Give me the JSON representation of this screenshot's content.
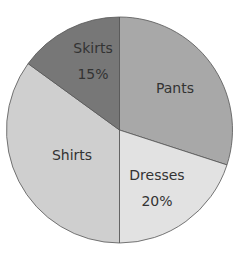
{
  "chart_data": {
    "type": "pie",
    "title": "",
    "start_angle_deg": 0,
    "direction": "clockwise",
    "slices": [
      {
        "name": "Pants",
        "value": 30,
        "label": "Pants",
        "value_label": "",
        "color": "#a8a8a8"
      },
      {
        "name": "Dresses",
        "value": 20,
        "label": "Dresses",
        "value_label": "20%",
        "color": "#e2e2e2"
      },
      {
        "name": "Shirts",
        "value": 35,
        "label": "Shirts",
        "value_label": "",
        "color": "#cfcfcf"
      },
      {
        "name": "Skirts",
        "value": 15,
        "label": "Skirts",
        "value_label": "15%",
        "color": "#777777"
      }
    ],
    "labels_visible": [
      "Pants",
      "Dresses",
      "20%",
      "Shirts",
      "Skirts",
      "15%"
    ],
    "legend": "none"
  }
}
